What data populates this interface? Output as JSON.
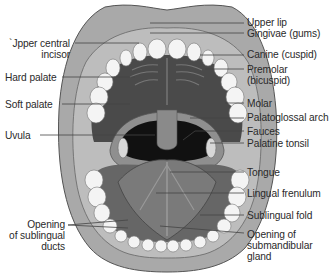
{
  "diagram": {
    "colors": {
      "lip": "#a9a9a9",
      "lip_outline": "#555555",
      "gum": "#bdbdbd",
      "teeth": "#f4f4f4",
      "palate": "#4a4a4a",
      "throat": "#111111",
      "tongue": "#7a7a7a",
      "leader": "#444444",
      "text": "#2a2a2a"
    },
    "labels_left": [
      {
        "id": "upper-central-incisor",
        "line1": "Upper central",
        "line2": "incisor",
        "display1": "`Jpper central"
      },
      {
        "id": "hard-palate",
        "line1": "Hard palate"
      },
      {
        "id": "soft-palate",
        "line1": "Soft palate"
      },
      {
        "id": "uvula",
        "line1": "Uvula"
      },
      {
        "id": "opening-of-sublingual-ducts",
        "line1": "Opening",
        "line2": "of sublingual",
        "line3": "ducts"
      }
    ],
    "labels_right": [
      {
        "id": "upper-lip",
        "line1": "Upper lip"
      },
      {
        "id": "gingivae",
        "line1": "Gingivae (gums)"
      },
      {
        "id": "canine",
        "line1": "Canine (cuspid)"
      },
      {
        "id": "premolar",
        "line1": "Premolar",
        "line2": "(bicuspid)"
      },
      {
        "id": "molar",
        "line1": "Molar"
      },
      {
        "id": "palatoglossal-arch",
        "line1": "Palatoglossal arch"
      },
      {
        "id": "fauces",
        "line1": "Fauces"
      },
      {
        "id": "palatine-tonsil",
        "line1": "Palatine tonsil"
      },
      {
        "id": "tongue",
        "line1": "Tongue"
      },
      {
        "id": "lingual-frenulum",
        "line1": "Lingual frenulum"
      },
      {
        "id": "sublingual-fold",
        "line1": "Sublingual fold"
      },
      {
        "id": "opening-of-submandibular-gland",
        "line1": "Opening of",
        "line2": "submandibular",
        "line3": "gland"
      }
    ]
  }
}
